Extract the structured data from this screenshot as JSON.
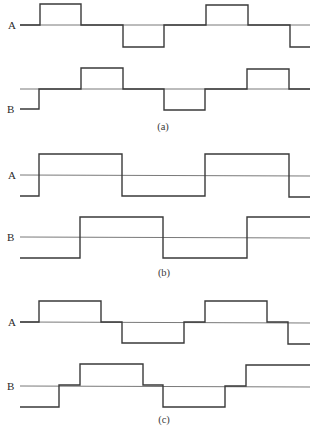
{
  "figure": {
    "panels": [
      {
        "id": "a",
        "caption": "(a)",
        "caption_pos": [
          163,
          130
        ],
        "signals": [
          {
            "label": "A",
            "label_pos": [
              8,
              29
            ],
            "baseline_y": 25,
            "axis": [
              [
                20,
                25
              ],
              [
                310,
                25
              ]
            ],
            "points": [
              [
                20,
                25
              ],
              [
                40,
                25
              ],
              [
                40,
                4
              ],
              [
                81,
                4
              ],
              [
                81,
                25
              ],
              [
                123,
                25
              ],
              [
                123,
                47
              ],
              [
                164,
                47
              ],
              [
                164,
                25
              ],
              [
                206,
                25
              ],
              [
                206,
                5
              ],
              [
                248,
                5
              ],
              [
                248,
                25
              ],
              [
                290,
                25
              ],
              [
                290,
                47
              ],
              [
                310,
                47
              ]
            ]
          },
          {
            "label": "B",
            "label_pos": [
              7,
              113
            ],
            "baseline_y": 89,
            "axis": [
              [
                20,
                89
              ],
              [
                310,
                89
              ]
            ],
            "points": [
              [
                20,
                109
              ],
              [
                39,
                109
              ],
              [
                39,
                89
              ],
              [
                81,
                89
              ],
              [
                81,
                68
              ],
              [
                123,
                68
              ],
              [
                123,
                89
              ],
              [
                164,
                89
              ],
              [
                164,
                110
              ],
              [
                205,
                110
              ],
              [
                205,
                89
              ],
              [
                247,
                89
              ],
              [
                247,
                69
              ],
              [
                289,
                69
              ],
              [
                289,
                89
              ],
              [
                310,
                89
              ]
            ]
          }
        ]
      },
      {
        "id": "b",
        "caption": "(b)",
        "caption_pos": [
          164,
          276
        ],
        "signals": [
          {
            "label": "A",
            "label_pos": [
              8,
              179
            ],
            "baseline_y": 175,
            "axis": [
              [
                20,
                175
              ],
              [
                310,
                176
              ]
            ],
            "points": [
              [
                20,
                196
              ],
              [
                39,
                196
              ],
              [
                39,
                154
              ],
              [
                122,
                154
              ],
              [
                122,
                196
              ],
              [
                205,
                196
              ],
              [
                205,
                154
              ],
              [
                289,
                154
              ],
              [
                289,
                197
              ],
              [
                310,
                197
              ]
            ]
          },
          {
            "label": "B",
            "label_pos": [
              7,
              241
            ],
            "baseline_y": 237,
            "axis": [
              [
                20,
                237
              ],
              [
                310,
                238
              ]
            ],
            "points": [
              [
                20,
                258
              ],
              [
                80,
                258
              ],
              [
                80,
                217
              ],
              [
                163,
                217
              ],
              [
                163,
                258
              ],
              [
                247,
                258
              ],
              [
                247,
                217
              ],
              [
                310,
                217
              ]
            ]
          }
        ]
      },
      {
        "id": "c",
        "caption": "(c)",
        "caption_pos": [
          164,
          423
        ],
        "signals": [
          {
            "label": "A",
            "label_pos": [
              8,
              326
            ],
            "baseline_y": 322,
            "axis": [
              [
                20,
                322
              ],
              [
                310,
                323
              ]
            ],
            "points": [
              [
                20,
                322
              ],
              [
                39,
                322
              ],
              [
                39,
                301
              ],
              [
                101,
                301
              ],
              [
                101,
                322
              ],
              [
                122,
                322
              ],
              [
                122,
                343
              ],
              [
                184,
                343
              ],
              [
                184,
                322
              ],
              [
                205,
                322
              ],
              [
                205,
                301
              ],
              [
                267,
                301
              ],
              [
                267,
                322
              ],
              [
                288,
                322
              ],
              [
                288,
                344
              ],
              [
                310,
                344
              ]
            ]
          },
          {
            "label": "B",
            "label_pos": [
              7,
              390
            ],
            "baseline_y": 386,
            "axis": [
              [
                20,
                386
              ],
              [
                310,
                387
              ]
            ],
            "points": [
              [
                20,
                407
              ],
              [
                59,
                407
              ],
              [
                59,
                385
              ],
              [
                80,
                385
              ],
              [
                80,
                364
              ],
              [
                143,
                364
              ],
              [
                143,
                385
              ],
              [
                163,
                385
              ],
              [
                163,
                407
              ],
              [
                225,
                407
              ],
              [
                225,
                386
              ],
              [
                246,
                386
              ],
              [
                246,
                365
              ],
              [
                310,
                365
              ]
            ]
          }
        ]
      }
    ],
    "colors": {
      "waveform": "#3a3a3a",
      "axis": "#6a6a6a",
      "background": "#ffffff"
    }
  }
}
